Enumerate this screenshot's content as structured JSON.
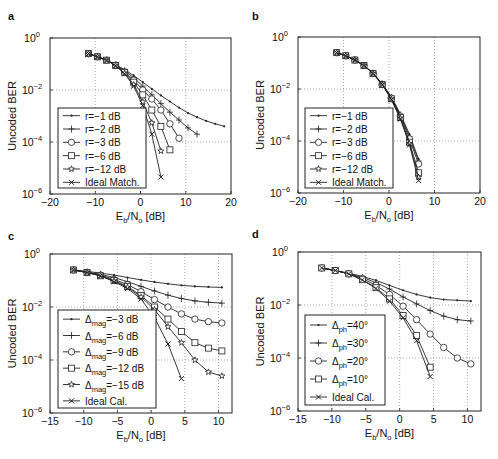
{
  "chart_data": [
    {
      "panel": "a",
      "type": "line",
      "xlabel": "Eb/No [dB]",
      "ylabel": "Uncoded BER",
      "xlim": [
        -20,
        20
      ],
      "xticks": [
        -20,
        -10,
        0,
        10,
        20
      ],
      "ylim_log10": [
        -6,
        0
      ],
      "yticks_log10": [
        0,
        -2,
        -4,
        -6
      ],
      "grid": true,
      "legend_position": "bottom-left",
      "series": [
        {
          "name": "r=−1 dB",
          "marker": "dot",
          "x": [
            -11.5,
            -9.5,
            -7.5,
            -5.5,
            -3.5,
            -1.5,
            0.5,
            2.5,
            4.5,
            6.5,
            8.5,
            10.5,
            12.5,
            14.5,
            16.5,
            18.5
          ],
          "y": [
            0.25,
            0.19,
            0.14,
            0.095,
            0.06,
            0.036,
            0.02,
            0.011,
            0.0062,
            0.0036,
            0.0021,
            0.0013,
            0.0009,
            0.00065,
            0.0005,
            0.0004
          ]
        },
        {
          "name": "r=−2 dB",
          "marker": "plus",
          "x": [
            -11.5,
            -9.5,
            -7.5,
            -5.5,
            -3.5,
            -1.5,
            0.5,
            2.5,
            4.5,
            6.5,
            8.5,
            10.5,
            12.5
          ],
          "y": [
            0.25,
            0.19,
            0.14,
            0.093,
            0.055,
            0.03,
            0.014,
            0.0065,
            0.003,
            0.0014,
            0.0007,
            0.00035,
            0.0002
          ]
        },
        {
          "name": "r=−3 dB",
          "marker": "circle",
          "x": [
            -11.5,
            -9.5,
            -7.5,
            -5.5,
            -3.5,
            -1.5,
            0.5,
            2.5,
            4.5,
            6.5,
            8.5
          ],
          "y": [
            0.25,
            0.19,
            0.14,
            0.09,
            0.05,
            0.024,
            0.01,
            0.0045,
            0.0017,
            0.0005,
            0.00014
          ]
        },
        {
          "name": "r=−6 dB",
          "marker": "square",
          "x": [
            -11.5,
            -9.5,
            -7.5,
            -5.5,
            -3.5,
            -1.5,
            0.5,
            2.5,
            4.5,
            6.5
          ],
          "y": [
            0.25,
            0.19,
            0.14,
            0.088,
            0.047,
            0.02,
            0.0065,
            0.0017,
            0.0004,
            5e-05
          ]
        },
        {
          "name": "r=−12 dB",
          "marker": "star",
          "x": [
            -11.5,
            -9.5,
            -7.5,
            -5.5,
            -3.5,
            -1.5,
            0.5,
            2.5,
            4.5
          ],
          "y": [
            0.25,
            0.19,
            0.14,
            0.086,
            0.044,
            0.016,
            0.0035,
            0.00055,
            4.5e-05
          ]
        },
        {
          "name": "Ideal Match.",
          "marker": "x",
          "x": [
            -11.5,
            -9.5,
            -7.5,
            -5.5,
            -3.5,
            -1.5,
            0.5,
            2.5,
            4.5
          ],
          "y": [
            0.25,
            0.19,
            0.14,
            0.085,
            0.042,
            0.014,
            0.0025,
            0.0002,
            4.5e-06
          ]
        }
      ]
    },
    {
      "panel": "b",
      "type": "line",
      "xlabel": "Eb/No [dB]",
      "ylabel": "Uncoded BER",
      "xlim": [
        -20,
        20
      ],
      "xticks": [
        -20,
        -10,
        0,
        10,
        20
      ],
      "ylim_log10": [
        -6,
        0
      ],
      "yticks_log10": [
        0,
        -2,
        -4,
        -6
      ],
      "grid": true,
      "legend_position": "bottom-left",
      "series": [
        {
          "name": "r=−1 dB",
          "marker": "dot",
          "x": [
            -11.5,
            -9.5,
            -7.5,
            -5.5,
            -3.5,
            -1.5,
            0.5,
            2.5,
            4.5,
            6.5
          ],
          "y": [
            0.25,
            0.19,
            0.13,
            0.08,
            0.04,
            0.016,
            0.005,
            0.0011,
            0.00018,
            2e-05
          ]
        },
        {
          "name": "r=−2 dB",
          "marker": "plus",
          "x": [
            -11.5,
            -9.5,
            -7.5,
            -5.5,
            -3.5,
            -1.5,
            0.5,
            2.5,
            4.5,
            6.5
          ],
          "y": [
            0.25,
            0.19,
            0.13,
            0.08,
            0.04,
            0.016,
            0.0048,
            0.001,
            0.00015,
            1.7e-05
          ]
        },
        {
          "name": "r=−3 dB",
          "marker": "circle",
          "x": [
            -11.5,
            -9.5,
            -7.5,
            -5.5,
            -3.5,
            -1.5,
            0.5,
            2.5,
            4.5,
            6.5
          ],
          "y": [
            0.25,
            0.19,
            0.13,
            0.08,
            0.04,
            0.015,
            0.0045,
            0.0009,
            0.00012,
            1.3e-05
          ]
        },
        {
          "name": "r=−6 dB",
          "marker": "square",
          "x": [
            -11.5,
            -9.5,
            -7.5,
            -5.5,
            -3.5,
            -1.5,
            0.5,
            2.5,
            4.5,
            6.5
          ],
          "y": [
            0.25,
            0.19,
            0.13,
            0.08,
            0.039,
            0.015,
            0.0042,
            0.0008,
            9e-05,
            6e-06
          ]
        },
        {
          "name": "r=−12 dB",
          "marker": "star",
          "x": [
            -11.5,
            -9.5,
            -7.5,
            -5.5,
            -3.5,
            -1.5,
            0.5,
            2.5,
            4.5,
            6.5
          ],
          "y": [
            0.25,
            0.19,
            0.13,
            0.08,
            0.039,
            0.015,
            0.004,
            0.00075,
            8e-05,
            4e-06
          ]
        },
        {
          "name": "Ideal Match.",
          "marker": "x",
          "x": [
            -11.5,
            -9.5,
            -7.5,
            -5.5,
            -3.5,
            -1.5,
            0.5,
            2.5,
            4.5,
            6.5
          ],
          "y": [
            0.25,
            0.19,
            0.13,
            0.08,
            0.039,
            0.015,
            0.004,
            0.0007,
            7e-05,
            3e-06
          ]
        }
      ]
    },
    {
      "panel": "c",
      "type": "line",
      "xlabel": "Eb/No [dB]",
      "ylabel": "Uncoded BER",
      "xlim": [
        -15,
        12
      ],
      "xticks": [
        -15,
        -10,
        -5,
        0,
        5,
        10
      ],
      "ylim_log10": [
        -6,
        0
      ],
      "yticks_log10": [
        0,
        -2,
        -4,
        -6
      ],
      "grid": true,
      "legend_position": "bottom-left",
      "series": [
        {
          "name": "Δmag=−3 dB",
          "sym": "Δ",
          "sub": "mag",
          "rest": "=−3 dB",
          "marker": "dot",
          "x": [
            -11.5,
            -9.5,
            -7.5,
            -5.5,
            -3.5,
            -1.5,
            0.5,
            2.5,
            4.5,
            6.5,
            8.5,
            10.5
          ],
          "y": [
            0.25,
            0.22,
            0.19,
            0.16,
            0.13,
            0.105,
            0.088,
            0.075,
            0.066,
            0.06,
            0.057,
            0.055
          ]
        },
        {
          "name": "Δmag=−6 dB",
          "sym": "Δ",
          "sub": "mag",
          "rest": "=−6 dB",
          "marker": "plus",
          "x": [
            -11.5,
            -9.5,
            -7.5,
            -5.5,
            -3.5,
            -1.5,
            0.5,
            2.5,
            4.5,
            6.5,
            8.5,
            10.5
          ],
          "y": [
            0.25,
            0.21,
            0.17,
            0.13,
            0.09,
            0.06,
            0.04,
            0.028,
            0.021,
            0.017,
            0.015,
            0.014
          ]
        },
        {
          "name": "Δmag=−9 dB",
          "sym": "Δ",
          "sub": "mag",
          "rest": "=−9 dB",
          "marker": "circle",
          "x": [
            -11.5,
            -9.5,
            -7.5,
            -5.5,
            -3.5,
            -1.5,
            0.5,
            2.5,
            4.5,
            6.5,
            8.5,
            10.5
          ],
          "y": [
            0.25,
            0.2,
            0.16,
            0.11,
            0.07,
            0.038,
            0.019,
            0.01,
            0.0055,
            0.0035,
            0.0028,
            0.0025
          ]
        },
        {
          "name": "Δmag=−12 dB",
          "sym": "Δ",
          "sub": "mag",
          "rest": "=−12 dB",
          "marker": "square",
          "x": [
            -11.5,
            -9.5,
            -7.5,
            -5.5,
            -3.5,
            -1.5,
            0.5,
            2.5,
            4.5,
            6.5,
            8.5,
            10.5
          ],
          "y": [
            0.25,
            0.2,
            0.15,
            0.1,
            0.06,
            0.027,
            0.01,
            0.0035,
            0.0012,
            0.00045,
            0.00028,
            0.00022
          ]
        },
        {
          "name": "Δmag=−15 dB",
          "sym": "Δ",
          "sub": "mag",
          "rest": "=−15 dB",
          "marker": "star",
          "x": [
            -11.5,
            -9.5,
            -7.5,
            -5.5,
            -3.5,
            -1.5,
            0.5,
            2.5,
            4.5,
            6.5,
            8.5,
            10.5
          ],
          "y": [
            0.25,
            0.2,
            0.15,
            0.095,
            0.055,
            0.024,
            0.008,
            0.0018,
            0.00045,
            0.0001,
            3.5e-05,
            2.5e-05
          ]
        },
        {
          "name": "Ideal Cal.",
          "marker": "x",
          "x": [
            -11.5,
            -9.5,
            -7.5,
            -5.5,
            -3.5,
            -1.5,
            0.5,
            2.5,
            4.5
          ],
          "y": [
            0.25,
            0.2,
            0.15,
            0.09,
            0.05,
            0.02,
            0.004,
            0.0004,
            2e-05
          ]
        }
      ]
    },
    {
      "panel": "d",
      "type": "line",
      "xlabel": "Eb/No [dB]",
      "ylabel": "Uncoded BER",
      "xlim": [
        -15,
        12
      ],
      "xticks": [
        -15,
        -10,
        -5,
        0,
        5,
        10
      ],
      "ylim_log10": [
        -6,
        0
      ],
      "yticks_log10": [
        0,
        -2,
        -4,
        -6
      ],
      "grid": true,
      "legend_position": "bottom-left",
      "series": [
        {
          "name": "Δph=40°",
          "sym": "Δ",
          "sub": "ph",
          "rest": "=40°",
          "marker": "dot",
          "x": [
            -11.5,
            -9.5,
            -7.5,
            -5.5,
            -3.5,
            -1.5,
            0.5,
            2.5,
            4.5,
            6.5,
            8.5,
            10.5
          ],
          "y": [
            0.25,
            0.2,
            0.16,
            0.12,
            0.085,
            0.055,
            0.036,
            0.025,
            0.019,
            0.016,
            0.015,
            0.014
          ]
        },
        {
          "name": "Δph=30°",
          "sym": "Δ",
          "sub": "ph",
          "rest": "=30°",
          "marker": "plus",
          "x": [
            -11.5,
            -9.5,
            -7.5,
            -5.5,
            -3.5,
            -1.5,
            0.5,
            2.5,
            4.5,
            6.5,
            8.5,
            10.5
          ],
          "y": [
            0.25,
            0.2,
            0.15,
            0.11,
            0.07,
            0.04,
            0.02,
            0.011,
            0.0062,
            0.0038,
            0.0028,
            0.0025
          ]
        },
        {
          "name": "Δph=20°",
          "sym": "Δ",
          "sub": "ph",
          "rest": "=20°",
          "marker": "circle",
          "x": [
            -11.5,
            -9.5,
            -7.5,
            -5.5,
            -3.5,
            -1.5,
            0.5,
            2.5,
            4.5,
            6.5,
            8.5,
            10.5
          ],
          "y": [
            0.25,
            0.2,
            0.15,
            0.1,
            0.055,
            0.025,
            0.009,
            0.0028,
            0.0008,
            0.00025,
            0.0001,
            6e-05
          ]
        },
        {
          "name": "Δph=10°",
          "sym": "Δ",
          "sub": "ph",
          "rest": "=10°",
          "marker": "square",
          "x": [
            -11.5,
            -9.5,
            -7.5,
            -5.5,
            -3.5,
            -1.5,
            0.5,
            2.5,
            4.5
          ],
          "y": [
            0.25,
            0.2,
            0.15,
            0.09,
            0.045,
            0.017,
            0.004,
            0.0007,
            4.5e-05
          ]
        },
        {
          "name": "Ideal Cal.",
          "marker": "x",
          "x": [
            -11.5,
            -9.5,
            -7.5,
            -5.5,
            -3.5,
            -1.5,
            0.5,
            2.5,
            4.5
          ],
          "y": [
            0.25,
            0.2,
            0.15,
            0.088,
            0.042,
            0.014,
            0.0033,
            0.00045,
            2e-05
          ]
        }
      ]
    }
  ]
}
